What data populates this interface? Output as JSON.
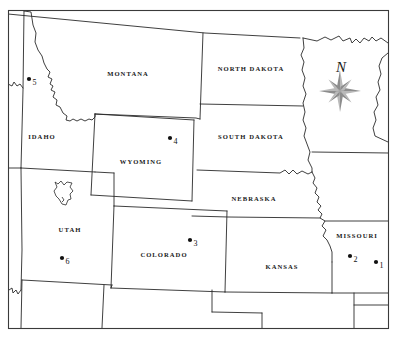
{
  "map": {
    "title": "Western and Central United States reference map",
    "frame": {
      "color": "#3a3a3a"
    },
    "states": [
      {
        "id": "montana",
        "label": "MONTANA",
        "x": 128,
        "y": 76
      },
      {
        "id": "north-dakota",
        "label": "NORTH DAKOTA",
        "x": 251,
        "y": 71
      },
      {
        "id": "south-dakota",
        "label": "SOUTH DAKOTA",
        "x": 251,
        "y": 139
      },
      {
        "id": "idaho",
        "label": "IDAHO",
        "x": 42,
        "y": 139
      },
      {
        "id": "wyoming",
        "label": "WYOMING",
        "x": 141,
        "y": 164
      },
      {
        "id": "nebraska",
        "label": "NEBRASKA",
        "x": 254,
        "y": 201
      },
      {
        "id": "utah",
        "label": "UTAH",
        "x": 70,
        "y": 232
      },
      {
        "id": "colorado",
        "label": "COLORADO",
        "x": 164,
        "y": 257
      },
      {
        "id": "kansas",
        "label": "KANSAS",
        "x": 282,
        "y": 269
      },
      {
        "id": "missouri",
        "label": "MISSOURI",
        "x": 357,
        "y": 238
      }
    ],
    "markers": [
      {
        "id": "marker-1",
        "label": "1",
        "state": "missouri",
        "dot_x": 376,
        "dot_y": 262,
        "label_x": 379.5,
        "label_y": 267.5
      },
      {
        "id": "marker-2",
        "label": "2",
        "state": "missouri",
        "dot_x": 350,
        "dot_y": 256,
        "label_x": 353.5,
        "label_y": 261.5
      },
      {
        "id": "marker-3",
        "label": "3",
        "state": "colorado",
        "dot_x": 190,
        "dot_y": 240,
        "label_x": 193.5,
        "label_y": 245.5
      },
      {
        "id": "marker-4",
        "label": "4",
        "state": "wyoming",
        "dot_x": 170,
        "dot_y": 138,
        "label_x": 173.5,
        "label_y": 143.5
      },
      {
        "id": "marker-5",
        "label": "5",
        "state": "idaho",
        "dot_x": 29,
        "dot_y": 79,
        "label_x": 32.5,
        "label_y": 84.5
      },
      {
        "id": "marker-6",
        "label": "6",
        "state": "utah",
        "dot_x": 62,
        "dot_y": 258,
        "label_x": 65.5,
        "label_y": 263.5
      }
    ],
    "compass": {
      "label": "N",
      "label_x": 341,
      "label_y": 72,
      "center_x": 340,
      "center_y": 91,
      "color_light": "#b9b9b9",
      "color_dark": "#8d8d8d"
    },
    "features": [
      {
        "id": "great-salt-lake",
        "type": "lake",
        "state": "utah"
      }
    ]
  }
}
